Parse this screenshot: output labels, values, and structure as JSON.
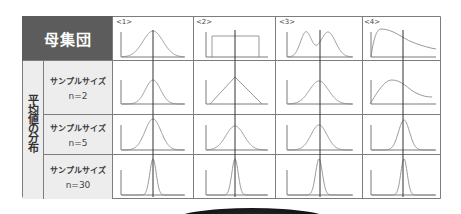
{
  "figure": {
    "header_label": "母集団",
    "vertical_label": "平均値の分布",
    "columns": [
      {
        "label": "<1>",
        "shape": "normal"
      },
      {
        "label": "<2>",
        "shape": "uniform"
      },
      {
        "label": "<3>",
        "shape": "bimodal"
      },
      {
        "label": "<4>",
        "shape": "right-skewed"
      }
    ],
    "rows": [
      {
        "title": "サンプルサイズ",
        "n": "n=2"
      },
      {
        "title": "サンプルサイズ",
        "n": "n=5"
      },
      {
        "title": "サンプルサイズ",
        "n": "n=30"
      }
    ]
  },
  "colors": {
    "header_bg": "#5c5c5c",
    "label_bg": "#ededed",
    "grid": "#7d7d7d",
    "axis": "#7a7a7a",
    "curve": "#9a9a9a",
    "mean_line": "#333333"
  },
  "chart_data": {
    "type": "diagram-grid",
    "title": "",
    "row_labels": [
      "母集団",
      "サンプルサイズ n=2",
      "サンプルサイズ n=5",
      "サンプルサイズ n=30"
    ],
    "col_labels": [
      "<1>",
      "<2>",
      "<3>",
      "<4>"
    ],
    "axes": {
      "cols": [
        {
          "axis_x": 121,
          "axis_end": 185,
          "mean_x": 153
        },
        {
          "axis_x": 206,
          "axis_end": 268,
          "mean_x": 235
        },
        {
          "axis_x": 287,
          "axis_end": 353,
          "mean_x": 320
        },
        {
          "axis_x": 371,
          "axis_end": 436,
          "mean_x": 403
        }
      ],
      "rows": [
        {
          "base_y": 57,
          "top_y": 32
        },
        {
          "base_y": 104,
          "top_y": 80
        },
        {
          "base_y": 150,
          "top_y": 125
        },
        {
          "base_y": 195,
          "top_y": 170
        }
      ],
      "mean_line_y": [
        30,
        197
      ]
    },
    "curves": [
      {
        "row": 0,
        "col": 0,
        "type": "normal",
        "mu": 153,
        "sd": 10,
        "peak_y": 31
      },
      {
        "row": 0,
        "col": 1,
        "type": "uniform",
        "x0": 212,
        "x1": 259,
        "top_y": 36
      },
      {
        "row": 0,
        "col": 2,
        "type": "bimodal",
        "components": [
          {
            "mu": 306,
            "sd": 5.5,
            "peak_y": 32
          },
          {
            "mu": 328,
            "sd": 7.5,
            "peak_y": 32
          }
        ]
      },
      {
        "row": 0,
        "col": 3,
        "type": "path",
        "d": "M371,57 C373,42 376,29 381,29 C393,29 402,38 412,42 C422,46 430,48 436,49"
      },
      {
        "row": 1,
        "col": 0,
        "type": "normal",
        "mu": 153,
        "sd": 7.5,
        "peak_y": 80
      },
      {
        "row": 1,
        "col": 1,
        "type": "triangular",
        "x0": 210,
        "peak_x": 235,
        "x1": 262,
        "peak_y": 77
      },
      {
        "row": 1,
        "col": 2,
        "type": "normal",
        "mu": 319,
        "sd": 9.5,
        "peak_y": 81
      },
      {
        "row": 1,
        "col": 3,
        "type": "path",
        "d": "M370,104 C377,93 384,80 392,80 C402,80 408,89 416,93 C422,96 427,97 432,97"
      },
      {
        "row": 2,
        "col": 0,
        "type": "normal",
        "mu": 153,
        "sd": 8,
        "peak_y": 119
      },
      {
        "row": 2,
        "col": 1,
        "type": "normal",
        "mu": 235,
        "sd": 9,
        "peak_y": 126
      },
      {
        "row": 2,
        "col": 2,
        "type": "normal",
        "mu": 319,
        "sd": 8,
        "peak_y": 125
      },
      {
        "row": 2,
        "col": 3,
        "type": "normal",
        "mu": 404,
        "sd": 5.5,
        "peak_y": 120
      },
      {
        "row": 3,
        "col": 0,
        "type": "normal",
        "mu": 153,
        "sd": 3.2,
        "peak_y": 159
      },
      {
        "row": 3,
        "col": 1,
        "type": "normal",
        "mu": 235,
        "sd": 3.2,
        "peak_y": 159
      },
      {
        "row": 3,
        "col": 2,
        "type": "normal",
        "mu": 319,
        "sd": 3.4,
        "peak_y": 159
      },
      {
        "row": 3,
        "col": 3,
        "type": "normal",
        "mu": 404,
        "sd": 3.2,
        "peak_y": 159
      }
    ]
  }
}
